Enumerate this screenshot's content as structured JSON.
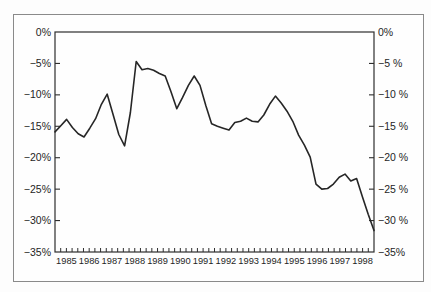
{
  "figure": {
    "background_color": "#fefefe",
    "border_color": "#8a8a8a",
    "axis_color": "#2e2e2e",
    "line_color": "#262626"
  },
  "chart_data": {
    "type": "line",
    "title": "",
    "xlabel": "",
    "ylabel": "",
    "grid": false,
    "legend": "none",
    "x_axis": {
      "years": [
        "1985",
        "1986",
        "1987",
        "1988",
        "1989",
        "1990",
        "1991",
        "1992",
        "1993",
        "1994",
        "1995",
        "1996",
        "1997",
        "1998"
      ],
      "ticks_per_year": 4
    },
    "y_axis": {
      "min": -35,
      "max": 0,
      "step": 5,
      "left_labels": [
        "0%",
        "−5%",
        "−10%",
        "−15%",
        "−20%",
        "−25%",
        "−30%",
        "−35%"
      ],
      "right_labels": [
        "0%",
        "−5 %",
        "−10 %",
        "−15 %",
        "−20 %",
        "−25 %",
        "−30 %",
        "−35%"
      ]
    },
    "series": [
      {
        "name": "quarterly-percentage-balance",
        "frequency": "quarterly",
        "start": "1985Q1",
        "end": "1998Q4",
        "values": [
          -15.9,
          -14.9,
          -13.9,
          -15.2,
          -16.2,
          -16.7,
          -15.3,
          -13.8,
          -11.5,
          -9.9,
          -13.1,
          -16.3,
          -18.1,
          -12.8,
          -4.7,
          -6.0,
          -5.8,
          -6.1,
          -6.6,
          -7.0,
          -9.5,
          -12.2,
          -10.4,
          -8.5,
          -7.0,
          -8.5,
          -11.7,
          -14.6,
          -15.0,
          -15.3,
          -15.6,
          -14.4,
          -14.2,
          -13.7,
          -14.2,
          -14.3,
          -13.2,
          -11.5,
          -10.2,
          -11.3,
          -12.6,
          -14.2,
          -16.4,
          -18.0,
          -19.9,
          -24.2,
          -25.0,
          -24.9,
          -24.2,
          -23.1,
          -22.6,
          -23.7,
          -23.3,
          -26.2,
          -29.0,
          -31.6
        ]
      }
    ]
  }
}
